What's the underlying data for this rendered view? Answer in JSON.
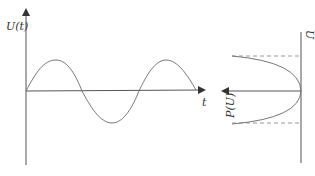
{
  "left_plot": {
    "y_label": "U(t)",
    "x_label": "t",
    "curve": "sine",
    "periods": 1.75
  },
  "right_plot": {
    "axis_label": "U",
    "dist_label": "P(U)",
    "curve": "parabola",
    "bounds": "dashed lines at ±amplitude"
  },
  "colors": {
    "axes": "#555555",
    "curve": "#777777",
    "dashed": "#999999"
  }
}
